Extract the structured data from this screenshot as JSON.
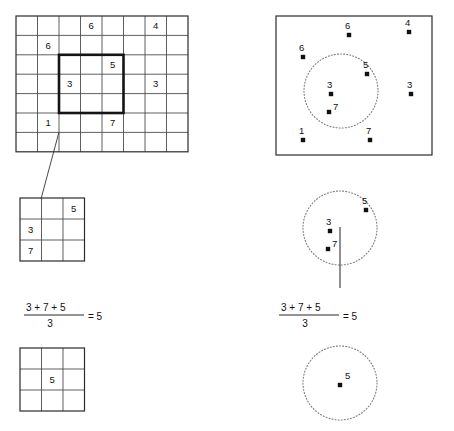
{
  "figure": {
    "caption": ""
  },
  "left_column": {
    "raster_grid": {
      "name": "source-raster-grid",
      "columns": 8,
      "rows": 7,
      "x": 16,
      "y": 16,
      "cell_width": 21.5,
      "cell_height": 19.4,
      "values": [
        {
          "col": 3,
          "row": 0,
          "value": "6"
        },
        {
          "col": 6,
          "row": 0,
          "value": "4"
        },
        {
          "col": 1,
          "row": 1,
          "value": "6"
        },
        {
          "col": 4,
          "row": 2,
          "value": "5"
        },
        {
          "col": 2,
          "row": 3,
          "value": "3"
        },
        {
          "col": 6,
          "row": 3,
          "value": "3"
        },
        {
          "col": 1,
          "row": 5,
          "value": "1"
        },
        {
          "col": 4,
          "row": 5,
          "value": "7"
        }
      ],
      "window": {
        "name": "moving-window-highlight",
        "col_start": 2,
        "row_start": 2,
        "cols": 3,
        "rows": 3
      }
    },
    "window_grid": {
      "name": "extracted-window-grid",
      "columns": 3,
      "rows": 3,
      "x": 20,
      "y": 198,
      "cell_width": 21.5,
      "cell_height": 21.0,
      "values": [
        {
          "col": 2,
          "row": 0,
          "value": "5"
        },
        {
          "col": 0,
          "row": 1,
          "value": "3"
        },
        {
          "col": 0,
          "row": 2,
          "value": "7"
        }
      ]
    },
    "formula": {
      "name": "grid-mean-formula",
      "numerator": "3 + 7 + 5",
      "denominator": "3",
      "equals": "= 5",
      "x": 22,
      "y": 308
    },
    "result_grid": {
      "name": "result-window-grid",
      "columns": 3,
      "rows": 3,
      "x": 20,
      "y": 348,
      "cell_width": 21.5,
      "cell_height": 21.0,
      "values": [
        {
          "col": 1,
          "row": 1,
          "value": "5"
        }
      ]
    }
  },
  "right_column": {
    "point_panel": {
      "name": "source-point-panel",
      "x": 276,
      "y": 16,
      "width": 156,
      "height": 139,
      "circle": {
        "cx": 341,
        "cy": 91,
        "r": 37
      },
      "points": [
        {
          "label": "6",
          "px": 349,
          "py": 35,
          "lx": 345,
          "ly": 29
        },
        {
          "label": "4",
          "px": 409,
          "py": 32,
          "lx": 405,
          "ly": 26
        },
        {
          "label": "6",
          "px": 303,
          "py": 57,
          "lx": 299,
          "ly": 51
        },
        {
          "label": "5",
          "px": 367,
          "py": 74,
          "lx": 363,
          "ly": 68
        },
        {
          "label": "3",
          "px": 331,
          "py": 94,
          "lx": 327,
          "ly": 88
        },
        {
          "label": "3",
          "px": 411,
          "py": 94,
          "lx": 407,
          "ly": 88
        },
        {
          "label": "7",
          "px": 329,
          "py": 112,
          "lx": 333,
          "ly": 110
        },
        {
          "label": "1",
          "px": 303,
          "py": 140,
          "lx": 299,
          "ly": 134
        },
        {
          "label": "7",
          "px": 370,
          "py": 140,
          "lx": 366,
          "ly": 134
        }
      ]
    },
    "window_circle": {
      "name": "extracted-window-circle",
      "cx": 340,
      "cy": 228,
      "r": 37,
      "points": [
        {
          "label": "5",
          "px": 366,
          "py": 210,
          "lx": 362,
          "ly": 204
        },
        {
          "label": "3",
          "px": 330,
          "py": 231,
          "lx": 326,
          "ly": 225
        },
        {
          "label": "7",
          "px": 328,
          "py": 249,
          "lx": 332,
          "ly": 247
        }
      ],
      "pointer": {
        "x1": 340,
        "y1": 227,
        "x2": 340,
        "y2": 288
      }
    },
    "formula": {
      "name": "point-mean-formula",
      "numerator": "3 + 7 + 5",
      "denominator": "3",
      "equals": "= 5",
      "x": 277,
      "y": 308
    },
    "result_circle": {
      "name": "result-window-circle",
      "cx": 340,
      "cy": 383,
      "r": 37,
      "points": [
        {
          "label": "5",
          "px": 340,
          "py": 385,
          "lx": 345,
          "ly": 379
        }
      ]
    }
  },
  "colors": {
    "ink": "#111111",
    "grid_line": "#4d4d4d",
    "grid_outer": "#2b2b2b",
    "window_stroke": "#141414",
    "dotted_stroke": "#7d7d7d",
    "background": "#ffffff"
  }
}
